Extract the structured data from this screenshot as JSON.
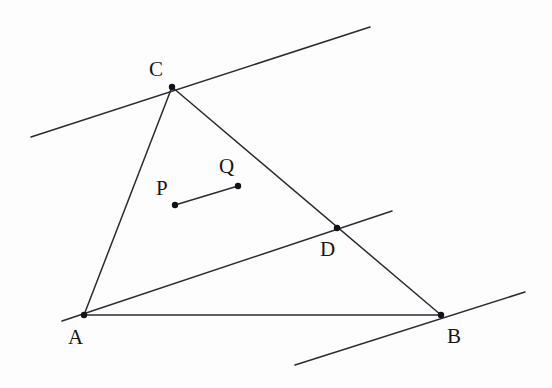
{
  "figure": {
    "type": "geometry-diagram",
    "canvas": {
      "width": 552,
      "height": 388
    },
    "background_color": "#fdfdfd",
    "stroke_color": "#2b2b33",
    "dot_color": "#111118",
    "label_color": "#161616",
    "stroke_width": 1.5,
    "dot_radius": 3.2
  },
  "points": [
    {
      "id": "A",
      "label": "A",
      "x": 84,
      "y": 315,
      "label_x": 68,
      "label_y": 327,
      "dot": true
    },
    {
      "id": "B",
      "label": "B",
      "x": 441,
      "y": 315,
      "label_x": 447,
      "label_y": 326,
      "dot": true
    },
    {
      "id": "C",
      "label": "C",
      "x": 172,
      "y": 87,
      "label_x": 149,
      "label_y": 59,
      "dot": true
    },
    {
      "id": "D",
      "label": "D",
      "x": 337,
      "y": 228,
      "label_x": 320,
      "label_y": 239,
      "dot": true
    },
    {
      "id": "P",
      "label": "P",
      "x": 175,
      "y": 205,
      "label_x": 156,
      "label_y": 178,
      "dot": true
    },
    {
      "id": "Q",
      "label": "Q",
      "x": 238,
      "y": 186,
      "label_x": 219,
      "label_y": 156,
      "dot": true
    }
  ],
  "segments": [
    {
      "id": "side-AC",
      "name": "triangle-side-AC",
      "x1": 84,
      "y1": 315,
      "x2": 172,
      "y2": 87
    },
    {
      "id": "side-AB",
      "name": "triangle-side-AB",
      "x1": 84,
      "y1": 315,
      "x2": 441,
      "y2": 315
    },
    {
      "id": "side-CB",
      "name": "triangle-side-CB",
      "x1": 172,
      "y1": 87,
      "x2": 441,
      "y2": 315
    },
    {
      "id": "cevian-AD",
      "name": "line-through-A-and-D",
      "x1": 62,
      "y1": 321,
      "x2": 392,
      "y2": 211
    },
    {
      "id": "tangent-C",
      "name": "tangent-line-at-C",
      "x1": 31,
      "y1": 137,
      "x2": 370,
      "y2": 27
    },
    {
      "id": "tangent-B",
      "name": "tangent-line-at-B",
      "x1": 295,
      "y1": 365,
      "x2": 525,
      "y2": 292
    },
    {
      "id": "segment-PQ",
      "name": "segment-PQ",
      "x1": 175,
      "y1": 205,
      "x2": 238,
      "y2": 186
    }
  ]
}
